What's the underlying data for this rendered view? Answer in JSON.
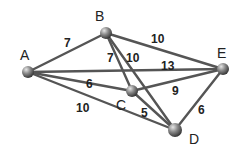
{
  "diagram": {
    "type": "weighted-undirected-graph",
    "nodes": [
      {
        "id": "A",
        "label": "A",
        "x": 28,
        "y": 72,
        "r": 6,
        "label_x": 20,
        "label_y": 60
      },
      {
        "id": "B",
        "label": "B",
        "x": 106,
        "y": 33,
        "r": 6,
        "label_x": 95,
        "label_y": 21
      },
      {
        "id": "C",
        "label": "C",
        "x": 132,
        "y": 91,
        "r": 6,
        "label_x": 116,
        "label_y": 110
      },
      {
        "id": "D",
        "label": "D",
        "x": 175,
        "y": 130,
        "r": 7,
        "label_x": 189,
        "label_y": 144
      },
      {
        "id": "E",
        "label": "E",
        "x": 223,
        "y": 69,
        "r": 6,
        "label_x": 217,
        "label_y": 58
      }
    ],
    "edges": [
      {
        "from": "A",
        "to": "B",
        "weight": "7",
        "label_x": 64,
        "label_y": 47
      },
      {
        "from": "A",
        "to": "E",
        "weight": "13",
        "label_x": 161,
        "label_y": 70
      },
      {
        "from": "A",
        "to": "C",
        "weight": "6",
        "label_x": 86,
        "label_y": 88
      },
      {
        "from": "A",
        "to": "D",
        "weight": "10",
        "label_x": 76,
        "label_y": 112
      },
      {
        "from": "B",
        "to": "C",
        "weight": "7",
        "label_x": 107,
        "label_y": 62
      },
      {
        "from": "B",
        "to": "D",
        "weight": "10",
        "label_x": 126,
        "label_y": 62
      },
      {
        "from": "B",
        "to": "E",
        "weight": "10",
        "label_x": 151,
        "label_y": 43
      },
      {
        "from": "C",
        "to": "E",
        "weight": "9",
        "label_x": 172,
        "label_y": 95
      },
      {
        "from": "C",
        "to": "D",
        "weight": "5",
        "label_x": 141,
        "label_y": 117
      },
      {
        "from": "D",
        "to": "E",
        "weight": "6",
        "label_x": 198,
        "label_y": 114
      }
    ],
    "colors": {
      "edge": "#555555",
      "node_light": "#d9d9d9",
      "node_dark": "#3a3a3a",
      "text": "#222222",
      "background": "#ffffff"
    }
  }
}
